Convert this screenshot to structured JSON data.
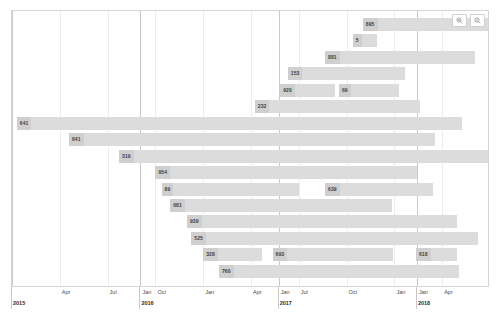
{
  "chart_data": {
    "type": "bar",
    "title": "",
    "subtitle": "",
    "xlabel": "",
    "ylabel": "",
    "orientation": "horizontal",
    "chart_style": "gantt",
    "grid": true,
    "legend": null,
    "x_axis": {
      "type": "time",
      "range": [
        "2015-01",
        "2018-06"
      ],
      "tick_labels": [
        "Apr",
        "Jul",
        "Oct",
        "Jan",
        "Apr",
        "Jul",
        "Oct",
        "Jan",
        "Apr",
        "Jul",
        "Oct",
        "Jan",
        "Apr"
      ],
      "tick_positions_pct": [
        10.2,
        20.4,
        30.6,
        40.8,
        51.0,
        61.2,
        71.4,
        81.6,
        91.8,
        102.0,
        112.2,
        122.4,
        132.6
      ],
      "year_labels": [
        "2015",
        "2016",
        "2017",
        "2018"
      ],
      "year_positions_pct": [
        0,
        27.4,
        56.9,
        86.4
      ]
    },
    "categories": [
      "row-1",
      "row-2",
      "row-3",
      "row-4",
      "row-5",
      "row-6",
      "row-7",
      "row-8",
      "row-9",
      "row-10",
      "row-11",
      "row-12",
      "row-13",
      "row-14",
      "row-15",
      "row-16"
    ],
    "bars": [
      {
        "row": 0,
        "label": "895",
        "start_pct": 73.4,
        "end_pct": 99.8
      },
      {
        "row": 1,
        "label": "5",
        "start_pct": 71.3,
        "end_pct": 76.4
      },
      {
        "row": 2,
        "label": "881",
        "start_pct": 65.5,
        "end_pct": 96.9
      },
      {
        "row": 3,
        "label": "153",
        "start_pct": 57.7,
        "end_pct": 82.2
      },
      {
        "row": 4,
        "label": "920",
        "start_pct": 56.1,
        "end_pct": 67.6
      },
      {
        "row": 4,
        "label": "69",
        "start_pct": 68.4,
        "end_pct": 81.0
      },
      {
        "row": 5,
        "label": "232",
        "start_pct": 50.8,
        "end_pct": 85.4
      },
      {
        "row": 6,
        "label": "641",
        "start_pct": 1.0,
        "end_pct": 94.1
      },
      {
        "row": 7,
        "label": "841",
        "start_pct": 11.9,
        "end_pct": 88.4
      },
      {
        "row": 8,
        "label": "319",
        "start_pct": 22.4,
        "end_pct": 99.8
      },
      {
        "row": 9,
        "label": "954",
        "start_pct": 30.0,
        "end_pct": 84.8
      },
      {
        "row": 10,
        "label": "89",
        "start_pct": 31.3,
        "end_pct": 60.0
      },
      {
        "row": 10,
        "label": "639",
        "start_pct": 65.5,
        "end_pct": 88.0
      },
      {
        "row": 11,
        "label": "681",
        "start_pct": 33.1,
        "end_pct": 79.6
      },
      {
        "row": 12,
        "label": "939",
        "start_pct": 36.6,
        "end_pct": 93.0
      },
      {
        "row": 13,
        "label": "525",
        "start_pct": 37.5,
        "end_pct": 97.5
      },
      {
        "row": 14,
        "label": "328",
        "start_pct": 40.0,
        "end_pct": 52.2
      },
      {
        "row": 14,
        "label": "693",
        "start_pct": 54.5,
        "end_pct": 79.8
      },
      {
        "row": 14,
        "label": "618",
        "start_pct": 84.5,
        "end_pct": 93.1
      },
      {
        "row": 15,
        "label": "760",
        "start_pct": 43.3,
        "end_pct": 93.5
      }
    ]
  },
  "toolbar": {
    "zoom_in_label": "+",
    "zoom_out_label": "−",
    "zoom_in_icon": "zoom-in-icon",
    "zoom_out_icon": "zoom-out-icon"
  },
  "colors": {
    "bar_fill": "#dcdcdc",
    "bar_label_fill": "#cfcfcf",
    "bar_label_text": "#3d3d3d",
    "grid_minor": "#ededed",
    "grid_major": "#c9c9c9",
    "plot_border": "#d6d6d6",
    "background": "#ffffff",
    "axis_text": "#4a4a4a",
    "year_text": "#2b2b2b"
  }
}
